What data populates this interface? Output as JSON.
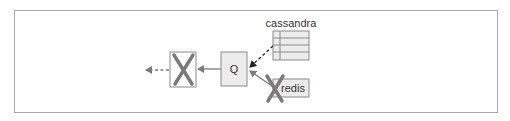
{
  "diagram": {
    "nodes": {
      "queue": {
        "label": "Q"
      },
      "cassandra": {
        "label": "cassandra",
        "rows": 4
      },
      "redis": {
        "label": "redis",
        "crossed_out": true
      },
      "removed_consumer": {
        "label": "",
        "crossed_out": true
      }
    },
    "edges": [
      {
        "from": "cassandra",
        "to": "queue",
        "style": "dashed"
      },
      {
        "from": "redis",
        "to": "queue",
        "style": "solid"
      },
      {
        "from": "queue",
        "to": "removed_consumer",
        "style": "solid"
      },
      {
        "from": "removed_consumer",
        "to": "output",
        "style": "dashed"
      }
    ],
    "colors": {
      "frame": "#a8a8a8",
      "box_fill": "#ececec",
      "box_stroke": "#8a8a8a",
      "cross": "#7a7a7a",
      "arrow": "#7a7a7a",
      "dashed_arrow": "#333333",
      "text": "#333333"
    }
  }
}
